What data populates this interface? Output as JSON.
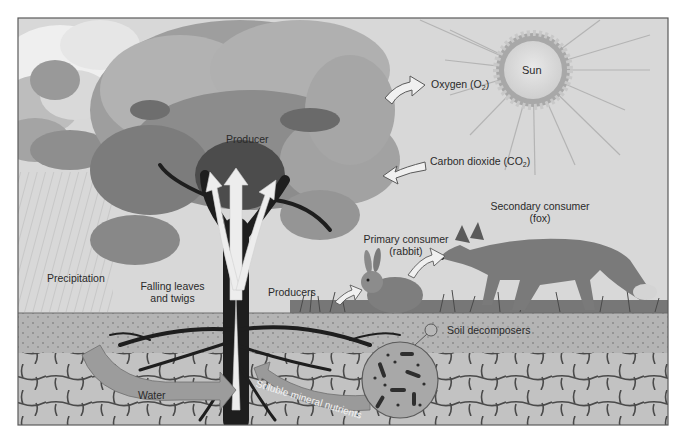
{
  "diagram": {
    "colors": {
      "sky": "#d6d6d6",
      "frame": "#5a5a5a",
      "canopy_light": "#a9a9a9",
      "canopy_dark": "#6a6a6a",
      "soil_top": "#a8a8a8",
      "soil_stone": "#c4c4c4",
      "arrow_fill": "#eeeeee",
      "band_arrow": "#9a9a9a",
      "sun_core": "#dcdcdc",
      "sun_rays": "#a0a0a0",
      "trunk": "#222222"
    },
    "labels": {
      "sun": "Sun",
      "oxygen": "Oxygen (O",
      "oxygen_sub": "2",
      "oxygen_close": ")",
      "carbon_dioxide": "Carbon dioxide (CO",
      "carbon_dioxide_sub": "2",
      "carbon_dioxide_close": ")",
      "producer": "Producer",
      "secondary_consumer_line1": "Secondary consumer",
      "secondary_consumer_line2": "(fox)",
      "primary_consumer_line1": "Primary consumer",
      "primary_consumer_line2": "(rabbit)",
      "precipitation": "Precipitation",
      "falling_leaves_line1": "Falling leaves",
      "falling_leaves_line2": "and twigs",
      "producers": "Producers",
      "soil_decomposers": "Soil decomposers",
      "water": "Water",
      "soluble_mineral_nutrients": "Soluble mineral nutrients"
    }
  }
}
